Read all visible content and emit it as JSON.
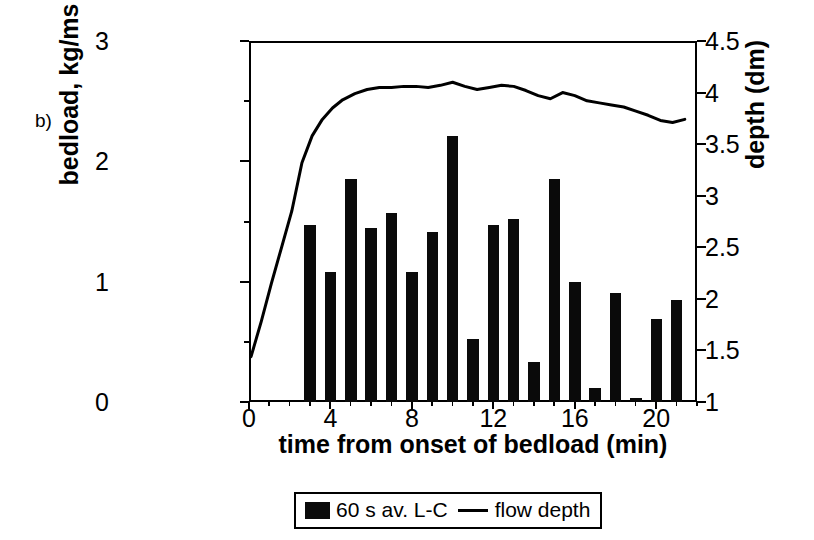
{
  "panel": {
    "label": "b)"
  },
  "axes": {
    "x": {
      "title": "time from onset of bedload (min)",
      "ticks": [
        0,
        4,
        8,
        12,
        16,
        20
      ],
      "range": [
        0,
        22
      ],
      "minor_step": 1
    },
    "y_left": {
      "title": "bedload, kg/ms",
      "ticks": [
        0,
        1,
        2,
        3
      ],
      "range": [
        0,
        3
      ]
    },
    "y_right": {
      "title": "depth (dm)",
      "ticks": [
        "1",
        "1.5",
        "2",
        "2.5",
        "3",
        "3.5",
        "4",
        "4.5"
      ],
      "range": [
        1,
        4.5
      ]
    }
  },
  "legend": {
    "bar_label": "60 s av. L-C",
    "line_label": "flow depth",
    "bar_color": "#0a0a0a",
    "line_color": "#000000"
  },
  "chart_data": {
    "type": "bar",
    "title": "",
    "xlabel": "time from onset of bedload (min)",
    "ylabel": "bedload, kg/ms",
    "y2label": "depth (dm)",
    "xlim": [
      0,
      22
    ],
    "ylim": [
      0,
      3
    ],
    "y2lim": [
      1,
      4.5
    ],
    "grid": false,
    "legend_position": "bottom-center",
    "series": [
      {
        "name": "60 s av. L-C",
        "type": "bar",
        "axis": "left",
        "units": "kg/ms",
        "x": [
          3,
          4,
          5,
          6,
          7,
          8,
          9,
          10,
          11,
          12,
          13,
          14,
          15,
          16,
          17,
          18,
          19,
          20,
          21
        ],
        "values": [
          1.47,
          1.08,
          1.85,
          1.45,
          1.57,
          1.08,
          1.41,
          2.21,
          0.52,
          1.47,
          1.52,
          0.33,
          1.85,
          1.0,
          0.12,
          0.91,
          0.03,
          0.69,
          0.85
        ]
      },
      {
        "name": "flow depth",
        "type": "line",
        "axis": "right",
        "units": "dm",
        "x": [
          0.1,
          0.6,
          1.1,
          1.6,
          2.1,
          2.6,
          3.1,
          3.6,
          4.1,
          4.6,
          5.2,
          5.8,
          6.4,
          7.0,
          7.6,
          8.2,
          8.8,
          9.4,
          10.0,
          10.6,
          11.2,
          11.8,
          12.4,
          13.0,
          13.6,
          14.2,
          14.8,
          15.4,
          16.0,
          16.6,
          17.2,
          17.8,
          18.4,
          19.0,
          19.6,
          20.2,
          20.8,
          21.4
        ],
        "values": [
          1.44,
          1.78,
          2.15,
          2.5,
          2.85,
          3.32,
          3.58,
          3.74,
          3.85,
          3.93,
          3.99,
          4.03,
          4.05,
          4.05,
          4.06,
          4.06,
          4.05,
          4.07,
          4.1,
          4.06,
          4.03,
          4.05,
          4.07,
          4.06,
          4.02,
          3.97,
          3.94,
          4.0,
          3.97,
          3.92,
          3.9,
          3.88,
          3.86,
          3.82,
          3.78,
          3.73,
          3.71,
          3.74
        ]
      }
    ]
  }
}
